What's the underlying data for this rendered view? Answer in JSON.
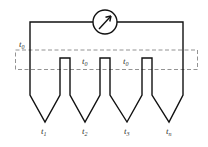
{
  "diagram": {
    "type": "thermopile-series-thermocouples",
    "meter": {
      "icon": "galvanometer-arrow-icon"
    },
    "reference_label": {
      "base": "t",
      "sub": "0"
    },
    "cold_labels": [
      {
        "base": "t",
        "sub": "0"
      },
      {
        "base": "t",
        "sub": "0"
      }
    ],
    "junction_labels": [
      {
        "base": "t",
        "sub": "1"
      },
      {
        "base": "t",
        "sub": "2"
      },
      {
        "base": "t",
        "sub": "3"
      },
      {
        "base": "t",
        "sub": "n"
      }
    ],
    "colors": {
      "wire": "#111111",
      "dashed": "#777777",
      "text": "#333333"
    }
  }
}
